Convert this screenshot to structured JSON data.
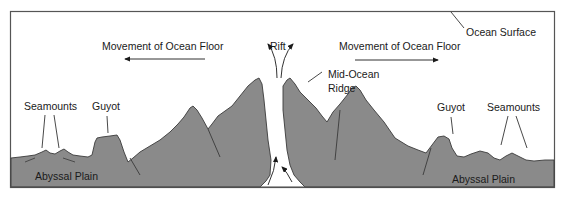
{
  "diagram": {
    "colors": {
      "frame": "#555555",
      "crust_fill": "#8a8a8a",
      "crust_outline": "#3a3a3a",
      "rift_fill": "#ffffff",
      "text": "#1a1a1a",
      "background": "#ffffff"
    },
    "labels": {
      "ocean_surface": "Ocean Surface",
      "movement_left": "Movement of Ocean Floor",
      "movement_right": "Movement of Ocean Floor",
      "rift": "Rift",
      "mid_ocean_ridge_line1": "Mid-Ocean",
      "mid_ocean_ridge_line2": "Ridge",
      "seamounts_left": "Seamounts",
      "guyot_left": "Guyot",
      "guyot_right": "Guyot",
      "seamounts_right": "Seamounts",
      "abyssal_plain_left": "Abyssal Plain",
      "abyssal_plain_right": "Abyssal Plain"
    },
    "arrows": {
      "movement_left_direction": "left",
      "movement_right_direction": "right",
      "rift_flow": "magma rising and diverging upward through rift"
    }
  }
}
